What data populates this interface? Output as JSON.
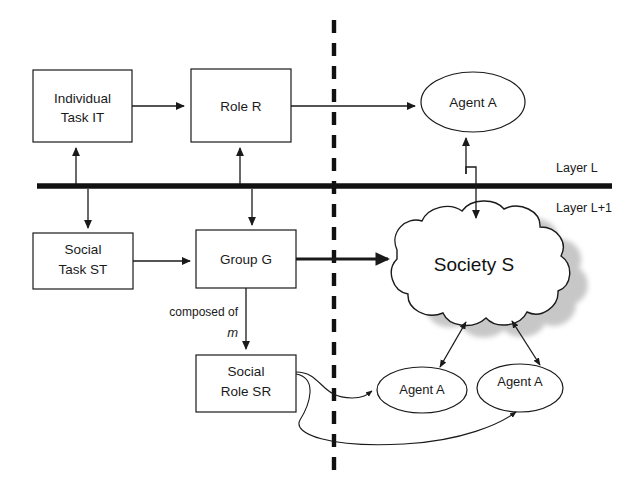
{
  "diagram": {
    "colors": {
      "stroke": "#1a1a1a",
      "background": "#ffffff",
      "divider": "#111111",
      "shadow": "#9a9a9a"
    },
    "layers": {
      "upper_label": "Layer L",
      "lower_label": "Layer L+1"
    },
    "nodes": {
      "individual_task": {
        "line1": "Individual",
        "line2": "Task IT"
      },
      "role": {
        "line1": "Role R"
      },
      "agent_top": {
        "line1": "Agent A"
      },
      "social_task": {
        "line1": "Social",
        "line2": "Task ST"
      },
      "group": {
        "line1": "Group G"
      },
      "society": {
        "line1": "Society S"
      },
      "social_role": {
        "line1": "Social",
        "line2": "Role SR"
      },
      "agent_bottom_left": {
        "line1": "Agent  A"
      },
      "agent_bottom_right": {
        "line1": "Agent A"
      }
    },
    "edges": {
      "group_to_social_role_label": "composed of",
      "group_to_social_role_multiplicity": "m"
    }
  }
}
